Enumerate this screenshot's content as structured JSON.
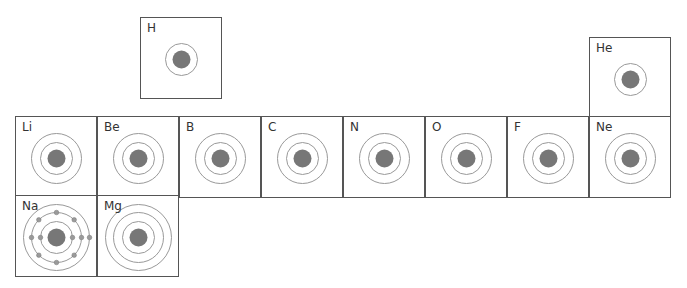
{
  "colors": {
    "border": "#555555",
    "shell": "#999999",
    "nucleus": "#777777",
    "electron": "#9a9a9a"
  },
  "cell_size": 81,
  "elements": [
    {
      "symbol": "H",
      "x": 140,
      "y": 17,
      "shells": [
        16
      ]
    },
    {
      "symbol": "He",
      "x": 589,
      "y": 37,
      "shells": [
        16
      ]
    },
    {
      "symbol": "Li",
      "x": 15,
      "y": 116,
      "shells": [
        16,
        25
      ]
    },
    {
      "symbol": "Be",
      "x": 97,
      "y": 116,
      "shells": [
        16,
        25
      ]
    },
    {
      "symbol": "B",
      "x": 179,
      "y": 116,
      "shells": [
        16,
        25
      ]
    },
    {
      "symbol": "C",
      "x": 261,
      "y": 116,
      "shells": [
        16,
        25
      ]
    },
    {
      "symbol": "N",
      "x": 343,
      "y": 116,
      "shells": [
        16,
        25
      ]
    },
    {
      "symbol": "O",
      "x": 425,
      "y": 116,
      "shells": [
        16,
        25
      ]
    },
    {
      "symbol": "F",
      "x": 507,
      "y": 116,
      "shells": [
        16,
        25
      ]
    },
    {
      "symbol": "Ne",
      "x": 589,
      "y": 116,
      "shells": [
        16,
        25
      ]
    },
    {
      "symbol": "Na",
      "x": 15,
      "y": 195,
      "shells": [
        16,
        25,
        33
      ],
      "electrons": [
        {
          "shell": 16,
          "angles": [
            0,
            180
          ]
        },
        {
          "shell": 25,
          "angles": [
            0,
            45,
            90,
            135,
            180,
            225,
            270,
            315
          ]
        },
        {
          "shell": 33,
          "angles": [
            0
          ]
        }
      ]
    },
    {
      "symbol": "Mg",
      "x": 97,
      "y": 195,
      "shells": [
        16,
        25,
        33
      ]
    }
  ]
}
